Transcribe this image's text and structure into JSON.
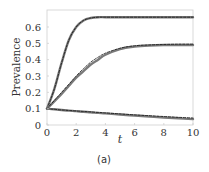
{
  "chart_data": {
    "type": "line",
    "title": "",
    "caption": "(a)",
    "xlabel": "t",
    "ylabel": "Prevalence",
    "xlim": [
      0,
      10
    ],
    "ylim": [
      0,
      0.68
    ],
    "xticks": [
      0,
      2,
      4,
      6,
      8,
      10
    ],
    "yticks": [
      0,
      0.1,
      0.2,
      0.3,
      0.4,
      0.5,
      0.6
    ],
    "ytick_labels": [
      "0",
      "0.1",
      "0.2",
      "0.3",
      "0.4",
      "0.5",
      "0.6"
    ],
    "grid": false,
    "legend": null,
    "x": [
      0,
      0.5,
      1,
      1.5,
      2,
      2.5,
      3,
      3.5,
      4,
      5,
      6,
      7,
      8,
      9,
      10
    ],
    "series": [
      {
        "name": "high-prevalence (simulation)",
        "style": "solid-gray",
        "values": [
          0.1,
          0.22,
          0.38,
          0.52,
          0.6,
          0.64,
          0.655,
          0.66,
          0.66,
          0.66,
          0.66,
          0.66,
          0.66,
          0.66,
          0.66
        ]
      },
      {
        "name": "high-prevalence (approximation)",
        "style": "dashed-black",
        "values": [
          0.1,
          0.22,
          0.38,
          0.52,
          0.6,
          0.64,
          0.655,
          0.66,
          0.66,
          0.66,
          0.66,
          0.66,
          0.66,
          0.66,
          0.66
        ]
      },
      {
        "name": "mid-prevalence (simulation)",
        "style": "solid-gray",
        "values": [
          0.1,
          0.145,
          0.19,
          0.24,
          0.29,
          0.33,
          0.37,
          0.4,
          0.43,
          0.465,
          0.48,
          0.487,
          0.49,
          0.49,
          0.49
        ]
      },
      {
        "name": "mid-prevalence (approximation)",
        "style": "dashed-black",
        "values": [
          0.1,
          0.15,
          0.2,
          0.25,
          0.3,
          0.345,
          0.385,
          0.415,
          0.44,
          0.47,
          0.485,
          0.49,
          0.493,
          0.495,
          0.495
        ]
      },
      {
        "name": "low-prevalence (simulation)",
        "style": "solid-gray",
        "values": [
          0.1,
          0.096,
          0.092,
          0.088,
          0.085,
          0.081,
          0.078,
          0.074,
          0.071,
          0.064,
          0.058,
          0.052,
          0.046,
          0.041,
          0.036
        ]
      },
      {
        "name": "low-prevalence (approximation)",
        "style": "dashed-black",
        "values": [
          0.1,
          0.096,
          0.092,
          0.089,
          0.086,
          0.083,
          0.08,
          0.077,
          0.074,
          0.068,
          0.062,
          0.057,
          0.052,
          0.047,
          0.043
        ]
      }
    ]
  }
}
